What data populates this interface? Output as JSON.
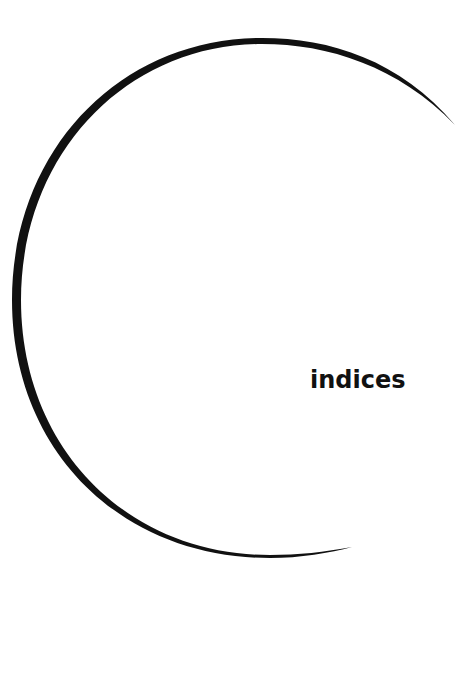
{
  "diagram": {
    "label": "indices",
    "arc": {
      "color": "#111111",
      "center": [
        270,
        298
      ],
      "radius": 258
    }
  }
}
